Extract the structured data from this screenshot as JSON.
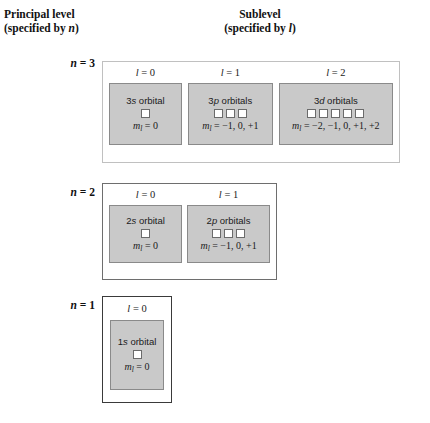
{
  "headings": {
    "principal": {
      "line1": "Principal level",
      "line2_prefix": "(specified by ",
      "line2_symbol": "n",
      "line2_suffix": ")"
    },
    "sublevel": {
      "line1": "Sublevel",
      "line2_prefix": "(specified by ",
      "line2_symbol": "l",
      "line2_suffix": ")"
    }
  },
  "diagram_data": {
    "type": "diagram",
    "title": "Principal levels and sublevels of atomic orbitals",
    "levels": [
      {
        "n_symbol": "n",
        "n_text": " = 3",
        "n_value": 3,
        "sublevels": [
          {
            "l_symbol": "l",
            "l_text": " = 0",
            "l_value": 0,
            "title_prefix": "3",
            "title_letter": "s",
            "title_suffix": " orbital",
            "orbital_count": 1,
            "ml_symbol": "m",
            "ml_sub": "l",
            "ml_values": " = 0"
          },
          {
            "l_symbol": "l",
            "l_text": " = 1",
            "l_value": 1,
            "title_prefix": "3",
            "title_letter": "p",
            "title_suffix": " orbitals",
            "orbital_count": 3,
            "ml_symbol": "m",
            "ml_sub": "l",
            "ml_values": " = −1, 0, +1"
          },
          {
            "l_symbol": "l",
            "l_text": " = 2",
            "l_value": 2,
            "title_prefix": "3",
            "title_letter": "d",
            "title_suffix": " orbitals",
            "orbital_count": 5,
            "ml_symbol": "m",
            "ml_sub": "l",
            "ml_values": " = −2, −1, 0, +1, +2"
          }
        ]
      },
      {
        "n_symbol": "n",
        "n_text": " = 2",
        "n_value": 2,
        "sublevels": [
          {
            "l_symbol": "l",
            "l_text": " = 0",
            "l_value": 0,
            "title_prefix": "2",
            "title_letter": "s",
            "title_suffix": " orbital",
            "orbital_count": 1,
            "ml_symbol": "m",
            "ml_sub": "l",
            "ml_values": " = 0"
          },
          {
            "l_symbol": "l",
            "l_text": " = 1",
            "l_value": 1,
            "title_prefix": "2",
            "title_letter": "p",
            "title_suffix": " orbitals",
            "orbital_count": 3,
            "ml_symbol": "m",
            "ml_sub": "l",
            "ml_values": " = −1, 0, +1"
          }
        ]
      },
      {
        "n_symbol": "n",
        "n_text": " = 1",
        "n_value": 1,
        "sublevels": [
          {
            "l_symbol": "l",
            "l_text": " = 0",
            "l_value": 0,
            "title_prefix": "1",
            "title_letter": "s",
            "title_suffix": " orbital",
            "orbital_count": 1,
            "ml_symbol": "m",
            "ml_sub": "l",
            "ml_values": " = 0"
          }
        ]
      }
    ],
    "colors": {
      "orbital_box_fill": "#c9c9c9",
      "orbital_box_border": "#8a8a8a",
      "orbital_square_fill": "#ffffff",
      "orbital_square_border": "#6b6b6b",
      "level_box_fill": "#ffffff",
      "background": "#ffffff",
      "text": "#1a1a1a"
    }
  }
}
